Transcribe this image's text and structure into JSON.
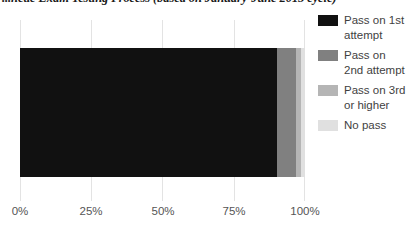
{
  "chart_data": {
    "type": "bar",
    "orientation": "horizontal",
    "stacked": true,
    "title": "...hetic Exam Testing Process (based on January-June 2015 cycle)",
    "xlabel": "",
    "ylabel": "",
    "categories": [
      ""
    ],
    "xlim": [
      0,
      100
    ],
    "xticks": [
      0,
      25,
      50,
      75,
      100
    ],
    "xtick_labels": [
      "0%",
      "25%",
      "50%",
      "75%",
      "100%"
    ],
    "grid": true,
    "legend_position": "right",
    "series": [
      {
        "name": "Pass on 1st attempt",
        "values": [
          90.0
        ],
        "color": "#111111"
      },
      {
        "name": "Pass on 2nd attempt",
        "values": [
          7.0
        ],
        "color": "#808080"
      },
      {
        "name": "Pass on 3rd or higher",
        "values": [
          1.5
        ],
        "color": "#b5b5b5"
      },
      {
        "name": "No pass",
        "values": [
          1.5
        ],
        "color": "#e0e0e0"
      }
    ]
  },
  "legend": {
    "items": [
      {
        "label": "Pass on 1st attempt",
        "color": "#111111"
      },
      {
        "label": "Pass on 2nd attempt",
        "color": "#808080"
      },
      {
        "label": "Pass on 3rd or higher",
        "color": "#b5b5b5"
      },
      {
        "label": "No pass",
        "color": "#e0e0e0"
      }
    ]
  },
  "axis": {
    "tick_labels": [
      "0%",
      "25%",
      "50%",
      "75%",
      "100%"
    ]
  },
  "colors": {
    "gridline": "#e3e3e3",
    "axis": "#b9b9b9",
    "text": "#3f3f3f",
    "title": "#1a1a1a"
  }
}
